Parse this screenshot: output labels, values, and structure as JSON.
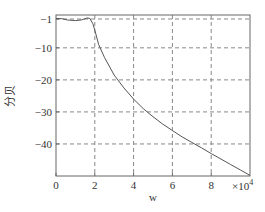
{
  "chart_data": {
    "type": "line",
    "title": "",
    "xlabel": "w",
    "ylabel": "分贝",
    "x_multiplier": "×10⁴",
    "x_multiplier_base": "×10",
    "x_multiplier_exp": "4",
    "xlim": [
      0,
      10
    ],
    "ylim": [
      -50,
      0.25
    ],
    "grid": true,
    "grid_style": "dashed",
    "x_ticks": [
      0,
      2,
      4,
      6,
      8
    ],
    "x_tick_labels": [
      "0",
      "2",
      "4",
      "6",
      "8"
    ],
    "y_ticks": [
      -1,
      -10,
      -20,
      -30,
      -40
    ],
    "y_tick_labels": [
      "-1",
      "-10",
      "-20",
      "-30",
      "-40"
    ],
    "series": [
      {
        "name": "magnitude response",
        "color": "#555555",
        "x": [
          0,
          0.3,
          0.6,
          1.0,
          1.3,
          1.6,
          1.75,
          1.9,
          2.0,
          2.2,
          2.5,
          3.0,
          3.5,
          4.0,
          4.5,
          5.0,
          5.5,
          6.0,
          6.5,
          7.0,
          7.5,
          8.0,
          8.5,
          9.0,
          9.5,
          10.0
        ],
        "y": [
          -0.8,
          -0.9,
          -1.3,
          -1.5,
          -1.3,
          -0.7,
          -0.8,
          -2.5,
          -4.5,
          -9,
          -13,
          -18.5,
          -22.5,
          -26,
          -29,
          -31.5,
          -33.8,
          -35.8,
          -37.8,
          -39.5,
          -41.2,
          -43,
          -44.7,
          -46.4,
          -48.1,
          -49.8
        ]
      }
    ]
  }
}
